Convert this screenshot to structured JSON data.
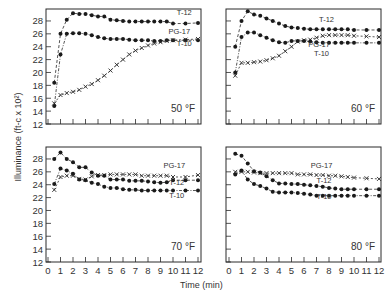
{
  "figure": {
    "ylabel": "Illuminance (ft-c x 10²)",
    "xlabel": "Time (min)"
  },
  "chart_data": [
    {
      "type": "line",
      "panel": "top-left",
      "annotation": "50 °F",
      "xlabel": "Time (min)",
      "ylabel": "Illuminance (ft-c x 10²)",
      "xlim": [
        0,
        12
      ],
      "ylim": [
        12,
        30
      ],
      "yticks": [
        12,
        14,
        16,
        18,
        20,
        22,
        24,
        26,
        28
      ],
      "x": [
        0.5,
        1,
        1.5,
        2,
        2.5,
        3,
        3.5,
        4,
        4.5,
        5,
        5.5,
        6,
        6.5,
        7,
        7.5,
        8,
        8.5,
        9,
        9.5,
        10,
        11,
        12
      ],
      "series": [
        {
          "name": "T-12",
          "marker": "dot",
          "values": [
            18.4,
            26,
            28.2,
            29.2,
            29.1,
            29.1,
            28.9,
            28.7,
            28.7,
            28.2,
            28.1,
            28.0,
            27.9,
            27.9,
            27.9,
            27.9,
            27.9,
            27.9,
            27.9,
            27.6,
            27.6,
            27.7
          ]
        },
        {
          "name": "T-10",
          "marker": "dot",
          "values": [
            14.8,
            22.8,
            26.0,
            26.1,
            26.1,
            26.0,
            25.8,
            25.5,
            25.3,
            25.2,
            25.2,
            25.2,
            25.1,
            25.0,
            25.0,
            25.0,
            24.9,
            24.9,
            25.0,
            25.0,
            25.0,
            25.0
          ]
        },
        {
          "name": "PG-17",
          "marker": "x",
          "values": [
            15.2,
            16.5,
            16.8,
            17.0,
            17.3,
            17.8,
            18.2,
            18.8,
            19.5,
            20.3,
            21.2,
            22.0,
            22.8,
            23.4,
            23.8,
            24.2,
            24.5,
            24.7,
            24.9,
            25.0,
            25.1,
            25.2
          ]
        }
      ]
    },
    {
      "type": "line",
      "panel": "top-right",
      "annotation": "60 °F",
      "xlim": [
        0,
        12
      ],
      "ylim": [
        12,
        30
      ],
      "x": [
        0.5,
        1,
        1.5,
        2,
        2.5,
        3,
        3.5,
        4,
        4.5,
        5,
        5.5,
        6,
        6.5,
        7,
        7.5,
        8,
        8.5,
        9,
        9.5,
        10,
        11,
        12
      ],
      "series": [
        {
          "name": "T-12",
          "marker": "dot",
          "values": [
            24.0,
            28.0,
            29.5,
            29.0,
            28.8,
            28.4,
            28.0,
            27.6,
            27.2,
            27.0,
            26.9,
            26.8,
            26.7,
            26.7,
            26.7,
            26.7,
            26.7,
            26.7,
            26.7,
            26.6,
            26.6,
            26.6
          ]
        },
        {
          "name": "PG-17",
          "marker": "x",
          "values": [
            19.5,
            21.5,
            21.5,
            21.6,
            21.7,
            21.9,
            22.2,
            22.6,
            23.3,
            24.0,
            24.8,
            25.0,
            25.1,
            25.4,
            25.7,
            25.8,
            25.8,
            25.8,
            25.8,
            25.7,
            25.6,
            25.5
          ]
        },
        {
          "name": "T-10",
          "marker": "dot",
          "values": [
            20.0,
            25.5,
            26.2,
            26.2,
            25.8,
            25.4,
            25.0,
            24.7,
            24.6,
            24.9,
            24.9,
            24.9,
            24.8,
            24.7,
            24.6,
            24.6,
            24.6,
            24.6,
            24.6,
            24.6,
            24.6,
            24.6
          ]
        }
      ]
    },
    {
      "type": "line",
      "panel": "bottom-left",
      "annotation": "70 °F",
      "xlim": [
        0,
        12
      ],
      "ylim": [
        12,
        30
      ],
      "xticks": [
        0,
        1,
        2,
        3,
        4,
        5,
        6,
        7,
        8,
        9,
        10,
        11,
        12
      ],
      "x": [
        0.5,
        1,
        1.5,
        2,
        2.5,
        3,
        3.5,
        4,
        4.5,
        5,
        5.5,
        6,
        6.5,
        7,
        7.5,
        8,
        8.5,
        9,
        9.5,
        10,
        11,
        12
      ],
      "series": [
        {
          "name": "PG-17",
          "marker": "x",
          "values": [
            23.2,
            25.2,
            25.4,
            25.4,
            24.9,
            24.8,
            25.3,
            25.5,
            25.5,
            25.6,
            25.6,
            25.6,
            25.6,
            25.6,
            25.4,
            25.4,
            25.4,
            25.4,
            25.4,
            25.2,
            25.2,
            25.5
          ]
        },
        {
          "name": "T-12",
          "marker": "dot",
          "values": [
            28.0,
            29.0,
            28.0,
            27.5,
            26.7,
            26.7,
            25.9,
            25.4,
            25.4,
            24.8,
            24.8,
            24.8,
            24.6,
            24.6,
            24.6,
            24.5,
            24.4,
            24.3,
            24.4,
            24.7,
            24.7,
            24.7
          ]
        },
        {
          "name": "T-10",
          "marker": "dot",
          "values": [
            24.1,
            26.5,
            26.2,
            25.7,
            24.8,
            24.7,
            24.3,
            24.1,
            23.7,
            23.5,
            23.5,
            23.3,
            23.2,
            23.2,
            23.1,
            23.1,
            23.1,
            23.1,
            23.1,
            23.1,
            23.1,
            23.1
          ]
        }
      ]
    },
    {
      "type": "line",
      "panel": "bottom-right",
      "annotation": "80 °F",
      "xlim": [
        0,
        12
      ],
      "ylim": [
        12,
        30
      ],
      "xticks": [
        0,
        1,
        2,
        3,
        4,
        5,
        6,
        7,
        8,
        9,
        10,
        11,
        12
      ],
      "x": [
        0.5,
        1,
        1.5,
        2,
        2.5,
        3,
        3.5,
        4,
        4.5,
        5,
        5.5,
        6,
        6.5,
        7,
        7.5,
        8,
        8.5,
        9,
        9.5,
        10,
        11,
        12
      ],
      "series": [
        {
          "name": "PG-17",
          "marker": "x",
          "values": [
            26.0,
            26.0,
            26.0,
            25.9,
            25.8,
            25.8,
            25.8,
            25.8,
            25.8,
            25.8,
            25.6,
            25.6,
            25.6,
            25.5,
            25.5,
            25.4,
            25.4,
            25.3,
            25.2,
            25.1,
            25.0,
            24.9
          ]
        },
        {
          "name": "T-12",
          "marker": "dot",
          "values": [
            28.8,
            28.5,
            27.3,
            26.1,
            25.9,
            25.3,
            24.7,
            24.2,
            24.2,
            24.1,
            24.1,
            24.0,
            23.9,
            23.8,
            23.7,
            23.5,
            23.4,
            23.3,
            23.3,
            23.3,
            23.3,
            23.3
          ]
        },
        {
          "name": "T-10",
          "marker": "dot",
          "values": [
            25.6,
            26.2,
            24.8,
            24.1,
            23.8,
            23.4,
            22.9,
            22.8,
            22.8,
            22.8,
            22.7,
            22.6,
            22.5,
            22.3,
            22.3,
            22.3,
            22.3,
            22.3,
            22.3,
            22.3,
            22.3,
            22.3
          ]
        }
      ]
    }
  ],
  "panels": [
    {
      "label": "50 °F",
      "labels": [
        {
          "text": "T-12",
          "x": 10.9,
          "y": 29.0
        },
        {
          "text": "PG-17",
          "x": 10.5,
          "y": 25.9
        },
        {
          "text": "T-10",
          "x": 10.9,
          "y": 24.1
        }
      ]
    },
    {
      "label": "60 °F",
      "labels": [
        {
          "text": "T-12",
          "x": 7.8,
          "y": 27.8
        },
        {
          "text": "PG-17",
          "x": 7.2,
          "y": 23.9
        },
        {
          "text": "T-10",
          "x": 7.4,
          "y": 22.6
        }
      ]
    },
    {
      "label": "70 °F",
      "labels": [
        {
          "text": "PG-17",
          "x": 10.1,
          "y": 26.6
        },
        {
          "text": "T-12",
          "x": 10.3,
          "y": 24.0
        },
        {
          "text": "T-10",
          "x": 10.3,
          "y": 22.0
        }
      ]
    },
    {
      "label": "80 °F",
      "labels": [
        {
          "text": "PG-17",
          "x": 7.4,
          "y": 26.6
        },
        {
          "text": "T-12",
          "x": 7.6,
          "y": 24.3
        },
        {
          "text": "T-10",
          "x": 7.6,
          "y": 21.8
        }
      ]
    }
  ]
}
